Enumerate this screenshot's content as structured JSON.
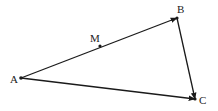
{
  "diagram": {
    "points": {
      "A": {
        "label": "A",
        "x": 21,
        "y": 78,
        "lx": 10,
        "ly": 83
      },
      "B": {
        "label": "B",
        "x": 177,
        "y": 18,
        "lx": 177,
        "ly": 13
      },
      "C": {
        "label": "C",
        "x": 195,
        "y": 99,
        "lx": 199,
        "ly": 104
      },
      "M": {
        "label": "M",
        "x": 100,
        "y": 46,
        "lx": 90,
        "ly": 42
      }
    },
    "vectors": [
      {
        "from": "A",
        "to": "B"
      },
      {
        "from": "B",
        "to": "C"
      },
      {
        "from": "A",
        "to": "C"
      }
    ],
    "color": "#1a1a1a"
  }
}
